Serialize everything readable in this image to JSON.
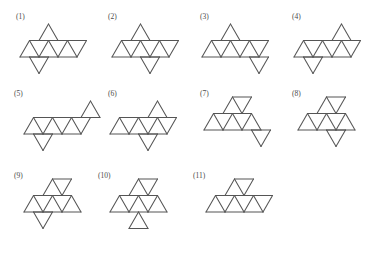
{
  "page": {
    "background_color": "#ffffff",
    "stroke_color": "#555555",
    "label_color": "#4a4a4a",
    "width": 391,
    "height": 257
  },
  "grid": {
    "cell_width": 19,
    "cell_height": 16.5,
    "description": "equilateral triangular lattice"
  },
  "figures": [
    {
      "id": 1,
      "label": "(1)",
      "label_x": 16,
      "label_y": 13,
      "origin_x": 18,
      "origin_y": 22,
      "triangles": 8,
      "cells": [
        {
          "col": 1,
          "row": 0,
          "dir": "up"
        },
        {
          "col": 0,
          "row": 1,
          "dir": "up"
        },
        {
          "col": 0,
          "row": 1,
          "dir": "down"
        },
        {
          "col": 1,
          "row": 1,
          "dir": "up"
        },
        {
          "col": 1,
          "row": 1,
          "dir": "down"
        },
        {
          "col": 2,
          "row": 1,
          "dir": "up"
        },
        {
          "col": 2,
          "row": 1,
          "dir": "down"
        },
        {
          "col": 0,
          "row": 2,
          "dir": "down"
        }
      ]
    },
    {
      "id": 2,
      "label": "(2)",
      "label_x": 108,
      "label_y": 13,
      "origin_x": 110,
      "origin_y": 22,
      "triangles": 8,
      "cells": [
        {
          "col": 1,
          "row": 0,
          "dir": "up"
        },
        {
          "col": 0,
          "row": 1,
          "dir": "up"
        },
        {
          "col": 0,
          "row": 1,
          "dir": "down"
        },
        {
          "col": 1,
          "row": 1,
          "dir": "up"
        },
        {
          "col": 1,
          "row": 1,
          "dir": "down"
        },
        {
          "col": 2,
          "row": 1,
          "dir": "up"
        },
        {
          "col": 2,
          "row": 1,
          "dir": "down"
        },
        {
          "col": 1,
          "row": 2,
          "dir": "down"
        }
      ]
    },
    {
      "id": 3,
      "label": "(3)",
      "label_x": 200,
      "label_y": 13,
      "origin_x": 200,
      "origin_y": 22,
      "triangles": 8,
      "cells": [
        {
          "col": 1,
          "row": 0,
          "dir": "up"
        },
        {
          "col": 0,
          "row": 1,
          "dir": "up"
        },
        {
          "col": 0,
          "row": 1,
          "dir": "down"
        },
        {
          "col": 1,
          "row": 1,
          "dir": "up"
        },
        {
          "col": 1,
          "row": 1,
          "dir": "down"
        },
        {
          "col": 2,
          "row": 1,
          "dir": "up"
        },
        {
          "col": 2,
          "row": 1,
          "dir": "down"
        },
        {
          "col": 2,
          "row": 2,
          "dir": "down"
        }
      ]
    },
    {
      "id": 4,
      "label": "(4)",
      "label_x": 292,
      "label_y": 13,
      "origin_x": 292,
      "origin_y": 22,
      "triangles": 8,
      "cells": [
        {
          "col": 2,
          "row": 0,
          "dir": "up"
        },
        {
          "col": 0,
          "row": 1,
          "dir": "up"
        },
        {
          "col": 0,
          "row": 1,
          "dir": "down"
        },
        {
          "col": 1,
          "row": 1,
          "dir": "up"
        },
        {
          "col": 1,
          "row": 1,
          "dir": "down"
        },
        {
          "col": 2,
          "row": 1,
          "dir": "up"
        },
        {
          "col": 2,
          "row": 1,
          "dir": "down"
        },
        {
          "col": 0,
          "row": 2,
          "dir": "down"
        }
      ]
    },
    {
      "id": 5,
      "label": "(5)",
      "label_x": 14,
      "label_y": 90,
      "origin_x": 22,
      "origin_y": 99,
      "triangles": 8,
      "cells": [
        {
          "col": 3,
          "row": 0,
          "dir": "up"
        },
        {
          "col": 0,
          "row": 1,
          "dir": "up"
        },
        {
          "col": 0,
          "row": 1,
          "dir": "down"
        },
        {
          "col": 1,
          "row": 1,
          "dir": "up"
        },
        {
          "col": 1,
          "row": 1,
          "dir": "down"
        },
        {
          "col": 2,
          "row": 1,
          "dir": "up"
        },
        {
          "col": 2,
          "row": 1,
          "dir": "down"
        },
        {
          "col": 0,
          "row": 2,
          "dir": "down"
        }
      ]
    },
    {
      "id": 6,
      "label": "(6)",
      "label_x": 108,
      "label_y": 90,
      "origin_x": 108,
      "origin_y": 99,
      "triangles": 8,
      "cells": [
        {
          "col": 2,
          "row": 0,
          "dir": "up"
        },
        {
          "col": 0,
          "row": 1,
          "dir": "up"
        },
        {
          "col": 0,
          "row": 1,
          "dir": "down"
        },
        {
          "col": 1,
          "row": 1,
          "dir": "up"
        },
        {
          "col": 1,
          "row": 1,
          "dir": "down"
        },
        {
          "col": 2,
          "row": 1,
          "dir": "up"
        },
        {
          "col": 2,
          "row": 1,
          "dir": "down"
        },
        {
          "col": 1,
          "row": 2,
          "dir": "down"
        }
      ]
    },
    {
      "id": 7,
      "label": "(7)",
      "label_x": 200,
      "label_y": 90,
      "origin_x": 202,
      "origin_y": 95,
      "triangles": 8,
      "cells": [
        {
          "col": 1,
          "row": 0,
          "dir": "up"
        },
        {
          "col": 1,
          "row": 0,
          "dir": "down"
        },
        {
          "col": 0,
          "row": 1,
          "dir": "up"
        },
        {
          "col": 0,
          "row": 1,
          "dir": "down"
        },
        {
          "col": 1,
          "row": 1,
          "dir": "up"
        },
        {
          "col": 1,
          "row": 1,
          "dir": "down"
        },
        {
          "col": 2,
          "row": 1,
          "dir": "up"
        },
        {
          "col": 2,
          "row": 2,
          "dir": "down"
        }
      ]
    },
    {
      "id": 8,
      "label": "(8)",
      "label_x": 292,
      "label_y": 90,
      "origin_x": 296,
      "origin_y": 95,
      "triangles": 8,
      "cells": [
        {
          "col": 1,
          "row": 0,
          "dir": "up"
        },
        {
          "col": 1,
          "row": 0,
          "dir": "down"
        },
        {
          "col": 0,
          "row": 1,
          "dir": "up"
        },
        {
          "col": 0,
          "row": 1,
          "dir": "down"
        },
        {
          "col": 1,
          "row": 1,
          "dir": "up"
        },
        {
          "col": 1,
          "row": 1,
          "dir": "down"
        },
        {
          "col": 2,
          "row": 1,
          "dir": "up"
        },
        {
          "col": 1,
          "row": 2,
          "dir": "down"
        }
      ]
    },
    {
      "id": 9,
      "label": "(9)",
      "label_x": 14,
      "label_y": 172,
      "origin_x": 22,
      "origin_y": 177,
      "triangles": 8,
      "cells": [
        {
          "col": 1,
          "row": 0,
          "dir": "up"
        },
        {
          "col": 1,
          "row": 0,
          "dir": "down"
        },
        {
          "col": 0,
          "row": 1,
          "dir": "up"
        },
        {
          "col": 0,
          "row": 1,
          "dir": "down"
        },
        {
          "col": 1,
          "row": 1,
          "dir": "up"
        },
        {
          "col": 1,
          "row": 1,
          "dir": "down"
        },
        {
          "col": 2,
          "row": 1,
          "dir": "up"
        },
        {
          "col": 0,
          "row": 2,
          "dir": "down"
        }
      ]
    },
    {
      "id": 10,
      "label": "(10)",
      "label_x": 98,
      "label_y": 172,
      "origin_x": 108,
      "origin_y": 177,
      "triangles": 8,
      "cells": [
        {
          "col": 1,
          "row": 0,
          "dir": "up"
        },
        {
          "col": 1,
          "row": 0,
          "dir": "down"
        },
        {
          "col": 0,
          "row": 1,
          "dir": "up"
        },
        {
          "col": 0,
          "row": 1,
          "dir": "down"
        },
        {
          "col": 1,
          "row": 1,
          "dir": "up"
        },
        {
          "col": 1,
          "row": 1,
          "dir": "down"
        },
        {
          "col": 2,
          "row": 1,
          "dir": "up"
        },
        {
          "col": 1,
          "row": 2,
          "dir": "up"
        }
      ]
    },
    {
      "id": 11,
      "label": "(11)",
      "label_x": 193,
      "label_y": 172,
      "origin_x": 204,
      "origin_y": 177,
      "triangles": 8,
      "cells": [
        {
          "col": 1,
          "row": 0,
          "dir": "up"
        },
        {
          "col": 1,
          "row": 0,
          "dir": "down"
        },
        {
          "col": 0,
          "row": 1,
          "dir": "up"
        },
        {
          "col": 0,
          "row": 1,
          "dir": "down"
        },
        {
          "col": 1,
          "row": 1,
          "dir": "up"
        },
        {
          "col": 1,
          "row": 1,
          "dir": "down"
        },
        {
          "col": 2,
          "row": 1,
          "dir": "up"
        },
        {
          "col": 2,
          "row": 1,
          "dir": "down"
        }
      ]
    }
  ]
}
